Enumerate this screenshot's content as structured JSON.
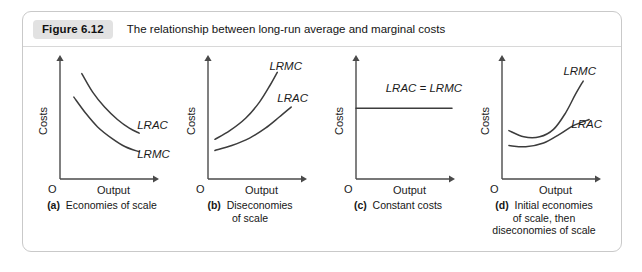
{
  "figure": {
    "badge": "Figure 6.12",
    "title": "The relationship between long-run average and marginal costs"
  },
  "axes": {
    "y_label": "Costs",
    "x_label": "Output",
    "origin": "O"
  },
  "colors": {
    "frame_border": "#c9c9c9",
    "badge_bg": "#e2e2e2",
    "curve": "#3c3c3c",
    "axis": "#4a4a4a",
    "text": "#1b1b1b"
  },
  "chart_data": [
    {
      "type": "line",
      "panel": "a",
      "title": "Economies of scale",
      "caption_letter": "(a)",
      "caption_lines": [
        "Economies of scale"
      ],
      "xlabel": "Output",
      "ylabel": "Costs",
      "grid": false,
      "legend": "inline-labels",
      "xlim": [
        0,
        100
      ],
      "ylim": [
        0,
        100
      ],
      "series": [
        {
          "name": "LRAC",
          "label": "LRAC",
          "label_x": 78,
          "label_y": 40,
          "points": [
            [
              22,
              85
            ],
            [
              33,
              70
            ],
            [
              45,
              58
            ],
            [
              58,
              48
            ],
            [
              70,
              41
            ],
            [
              80,
              37
            ]
          ]
        },
        {
          "name": "LRMC",
          "label": "LRMC",
          "label_x": 78,
          "label_y": 17,
          "points": [
            [
              14,
              66
            ],
            [
              26,
              53
            ],
            [
              38,
              42
            ],
            [
              52,
              33
            ],
            [
              66,
              26
            ],
            [
              80,
              22
            ]
          ]
        }
      ]
    },
    {
      "type": "line",
      "panel": "b",
      "title": "Diseconomies of scale",
      "caption_letter": "(b)",
      "caption_lines": [
        "Diseconomies",
        "of scale"
      ],
      "xlabel": "Output",
      "ylabel": "Costs",
      "grid": false,
      "legend": "inline-labels",
      "xlim": [
        0,
        100
      ],
      "ylim": [
        0,
        100
      ],
      "series": [
        {
          "name": "LRMC",
          "label": "LRMC",
          "label_x": 62,
          "label_y": 88,
          "points": [
            [
              7,
              32
            ],
            [
              22,
              39
            ],
            [
              38,
              49
            ],
            [
              52,
              62
            ],
            [
              63,
              76
            ],
            [
              70,
              86
            ]
          ]
        },
        {
          "name": "LRAC",
          "label": "LRAC",
          "label_x": 70,
          "label_y": 62,
          "points": [
            [
              7,
              23
            ],
            [
              24,
              27
            ],
            [
              42,
              33
            ],
            [
              58,
              41
            ],
            [
              72,
              50
            ],
            [
              84,
              58
            ]
          ]
        }
      ]
    },
    {
      "type": "line",
      "panel": "c",
      "title": "Constant costs",
      "caption_letter": "(c)",
      "caption_lines": [
        "Constant costs"
      ],
      "xlabel": "Output",
      "ylabel": "Costs",
      "grid": false,
      "legend": "inline-labels",
      "xlim": [
        0,
        100
      ],
      "ylim": [
        0,
        100
      ],
      "series": [
        {
          "name": "LRAC = LRMC",
          "label": "LRAC = LRMC",
          "label_x": 30,
          "label_y": 70,
          "points": [
            [
              0,
              57
            ],
            [
              25,
              57
            ],
            [
              50,
              57
            ],
            [
              75,
              57
            ],
            [
              97,
              57
            ]
          ]
        }
      ]
    },
    {
      "type": "line",
      "panel": "d",
      "title": "Initial economies of scale, then diseconomies of scale",
      "caption_letter": "(d)",
      "caption_lines": [
        "Initial economies",
        "of scale, then",
        "diseconomies of scale"
      ],
      "xlabel": "Output",
      "ylabel": "Costs",
      "grid": false,
      "legend": "inline-labels",
      "xlim": [
        0,
        100
      ],
      "ylim": [
        0,
        100
      ],
      "series": [
        {
          "name": "LRMC",
          "label": "LRMC",
          "label_x": 62,
          "label_y": 84,
          "points": [
            [
              7,
              39
            ],
            [
              22,
              34
            ],
            [
              38,
              34
            ],
            [
              52,
              40
            ],
            [
              64,
              53
            ],
            [
              74,
              68
            ],
            [
              82,
              79
            ]
          ]
        },
        {
          "name": "LRAC",
          "label": "LRAC",
          "label_x": 70,
          "label_y": 41,
          "points": [
            [
              7,
              27
            ],
            [
              24,
              26
            ],
            [
              42,
              29
            ],
            [
              58,
              36
            ],
            [
              72,
              43
            ],
            [
              88,
              48
            ]
          ]
        }
      ]
    }
  ]
}
